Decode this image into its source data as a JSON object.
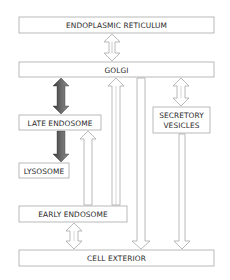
{
  "diagram": {
    "type": "flow",
    "nodes": [
      {
        "id": "er",
        "label": "ENDOPLASMIC RETICULUM"
      },
      {
        "id": "golgi",
        "label": "GOLGI"
      },
      {
        "id": "late_endosome",
        "label": "LATE ENDOSOME"
      },
      {
        "id": "secretory_vesicles",
        "label_line1": "SECRETORY",
        "label_line2": "VESICLES"
      },
      {
        "id": "lysosome",
        "label": "LYSOSOME"
      },
      {
        "id": "early_endosome",
        "label": "EARLY ENDOSOME"
      },
      {
        "id": "cell_exterior",
        "label": "CELL EXTERIOR"
      }
    ],
    "edges": [
      {
        "from": "er",
        "to": "golgi",
        "style": "open",
        "direction": "both"
      },
      {
        "from": "golgi",
        "to": "late_endosome",
        "style": "dark",
        "direction": "both"
      },
      {
        "from": "late_endosome",
        "to": "lysosome",
        "style": "dark",
        "direction": "forward"
      },
      {
        "from": "golgi",
        "to": "secretory_vesicles",
        "style": "open",
        "direction": "both"
      },
      {
        "from": "early_endosome",
        "to": "late_endosome",
        "style": "open",
        "direction": "forward"
      },
      {
        "from": "early_endosome",
        "to": "golgi",
        "style": "open",
        "direction": "forward"
      },
      {
        "from": "golgi",
        "to": "early_endosome",
        "style": "open",
        "direction": "forward"
      },
      {
        "from": "golgi",
        "to": "cell_exterior",
        "style": "open",
        "direction": "forward"
      },
      {
        "from": "secretory_vesicles",
        "to": "cell_exterior",
        "style": "open",
        "direction": "forward"
      },
      {
        "from": "early_endosome",
        "to": "cell_exterior",
        "style": "open",
        "direction": "both"
      }
    ],
    "colors": {
      "box_stroke": "#a8a8a8",
      "dark_arrow": "#555555",
      "open_arrow_stroke": "#a8a8a8"
    }
  }
}
